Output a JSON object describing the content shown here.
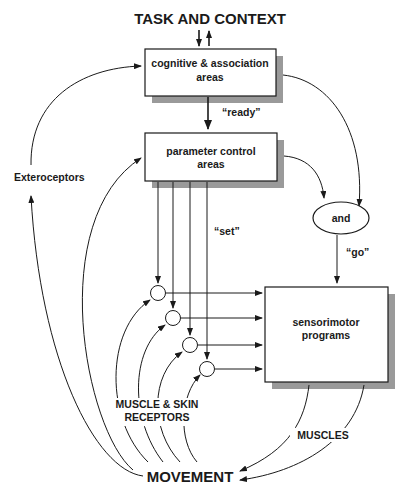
{
  "diagram": {
    "title": "TASK AND CONTEXT",
    "nodes": {
      "cognitive": {
        "line1": "cognitive & association",
        "line2": "areas"
      },
      "parameter": {
        "line1": "parameter control",
        "line2": "areas"
      },
      "and_gate": {
        "label": "and"
      },
      "sensorimotor": {
        "line1": "sensorimotor",
        "line2": "programs"
      },
      "movement": {
        "label": "MOVEMENT"
      }
    },
    "edge_labels": {
      "ready": "“ready”",
      "set": "“set”",
      "go": "“go”",
      "exteroceptors": "Exteroceptors",
      "receptors_line1": "MUSCLE & SKIN",
      "receptors_line2": "RECEPTORS",
      "muscles": "MUSCLES"
    },
    "colors": {
      "ink": "#1a1a1a",
      "shadow": "#9a9a9a",
      "background": "#ffffff"
    }
  }
}
